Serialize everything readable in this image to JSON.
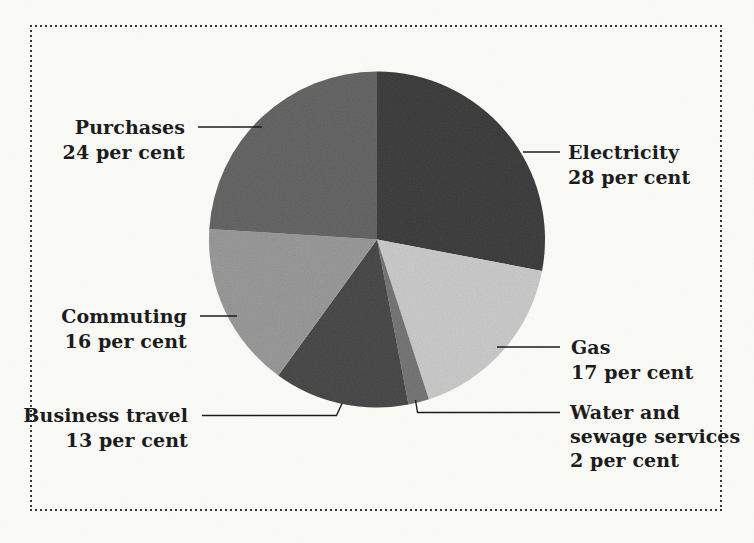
{
  "page": {
    "paper_color": "#fcfcf9",
    "ink_color": "#1c1c1c",
    "border_color": "#2e2e2e"
  },
  "chart_data": {
    "type": "pie",
    "unit": "per cent",
    "start_angle_deg": 0,
    "direction": "clockwise",
    "legend": "none",
    "label_style": "callout labels with leader lines",
    "categories": [
      "Electricity",
      "Gas",
      "Water and sewage services",
      "Business travel",
      "Commuting",
      "Purchases"
    ],
    "values": [
      28,
      17,
      2,
      13,
      16,
      24
    ],
    "slices": [
      {
        "id": "electricity",
        "name": "Electricity",
        "value": 28,
        "label_lines": [
          "Electricity"
        ],
        "value_label": "28 per cent",
        "color": "#2b2b2b"
      },
      {
        "id": "gas",
        "name": "Gas",
        "value": 17,
        "label_lines": [
          "Gas"
        ],
        "value_label": "17 per cent",
        "color": "#c7c7c7"
      },
      {
        "id": "water",
        "name": "Water and sewage services",
        "value": 2,
        "label_lines": [
          "Water and",
          "sewage services"
        ],
        "value_label": "2 per cent",
        "color": "#696969"
      },
      {
        "id": "business-travel",
        "name": "Business travel",
        "value": 13,
        "label_lines": [
          "Business travel"
        ],
        "value_label": "13 per cent",
        "color": "#383838"
      },
      {
        "id": "commuting",
        "name": "Commuting",
        "value": 16,
        "label_lines": [
          "Commuting"
        ],
        "value_label": "16 per cent",
        "color": "#909090"
      },
      {
        "id": "purchases",
        "name": "Purchases",
        "value": 24,
        "label_lines": [
          "Purchases"
        ],
        "value_label": "24 per cent",
        "color": "#575757"
      }
    ]
  }
}
